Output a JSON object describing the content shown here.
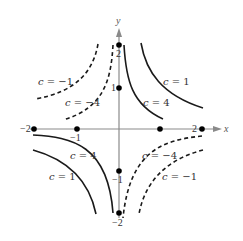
{
  "diagram": {
    "type": "level-curves",
    "axes": {
      "x_label": "x",
      "y_label": "y",
      "x_ticks": [
        "−2",
        "−1",
        "2"
      ],
      "y_ticks": [
        "2",
        "1",
        "−1",
        "−2"
      ],
      "x_range": [
        -2,
        2
      ],
      "y_range": [
        -2,
        2
      ]
    },
    "points": [
      {
        "x": -2,
        "y": 0
      },
      {
        "x": -1,
        "y": 0
      },
      {
        "x": 1,
        "y": 0
      },
      {
        "x": 2,
        "y": 0
      },
      {
        "x": 0,
        "y": 2
      },
      {
        "x": 0,
        "y": 1
      },
      {
        "x": 0,
        "y": -1
      },
      {
        "x": 0,
        "y": -2
      }
    ],
    "curves": [
      {
        "quadrant": "I",
        "label_var": "c",
        "label_eq": " = 1",
        "style": "solid"
      },
      {
        "quadrant": "I",
        "label_var": "c",
        "label_eq": " = 4",
        "style": "solid"
      },
      {
        "quadrant": "II",
        "label_var": "c",
        "label_eq": " = −1",
        "style": "dashed"
      },
      {
        "quadrant": "II",
        "label_var": "c",
        "label_eq": " = −4",
        "style": "dashed"
      },
      {
        "quadrant": "III",
        "label_var": "c",
        "label_eq": " = 4",
        "style": "solid"
      },
      {
        "quadrant": "III",
        "label_var": "c",
        "label_eq": " = 1",
        "style": "solid"
      },
      {
        "quadrant": "IV",
        "label_var": "c",
        "label_eq": " = −4",
        "style": "dashed"
      },
      {
        "quadrant": "IV",
        "label_var": "c",
        "label_eq": " = −1",
        "style": "dashed"
      }
    ],
    "colors": {
      "curve": "#1a1a1a",
      "axis": "#8a8a8a",
      "point": "#000000",
      "text": "#333333"
    }
  }
}
